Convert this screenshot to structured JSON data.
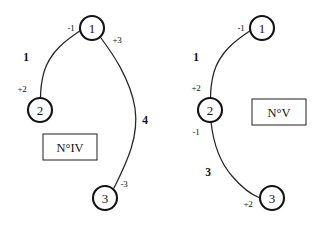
{
  "figure": {
    "background_color": "#ffffff",
    "ink_color": "#141414",
    "diagrams": [
      {
        "id": "diagram-iv",
        "caption": "N°IV",
        "nodes": [
          {
            "id": "n1",
            "label": "1",
            "cx": 92,
            "cy": 28,
            "r": 12
          },
          {
            "id": "n2",
            "label": "2",
            "cx": 40,
            "cy": 110,
            "r": 12
          },
          {
            "id": "n3",
            "label": "3",
            "cx": 105,
            "cy": 198,
            "r": 12
          }
        ],
        "edges": [
          {
            "id": "e12",
            "from": "n1",
            "to": "n2",
            "weight": "1",
            "weight_x": 26,
            "weight_y": 57,
            "tail_port": "-1",
            "tail_port_x": 71,
            "tail_port_y": 28,
            "head_port": "+2",
            "head_port_x": 22,
            "head_port_y": 89,
            "path": "M 80.5 30.5 C 66 40 50 52 44 72 C 41.5 81 40.5 90 40.5 98"
          },
          {
            "id": "e13",
            "from": "n1",
            "to": "n3",
            "weight": "4",
            "weight_x": 145,
            "weight_y": 120,
            "tail_port": "+3",
            "tail_port_x": 117,
            "tail_port_y": 40,
            "head_port": "-3",
            "head_port_x": 124,
            "head_port_y": 184,
            "path": "M 101 38 C 112 53 130 78 135 108 C 139 136 128 160 114 188"
          }
        ],
        "box": {
          "x": 43,
          "y": 134,
          "width": 54,
          "height": 26
        }
      },
      {
        "id": "diagram-v",
        "caption": "N°V",
        "nodes": [
          {
            "id": "n1",
            "label": "1",
            "cx": 262,
            "cy": 28,
            "r": 12
          },
          {
            "id": "n2",
            "label": "2",
            "cx": 210,
            "cy": 110,
            "r": 12
          },
          {
            "id": "n3",
            "label": "3",
            "cx": 272,
            "cy": 198,
            "r": 12
          }
        ],
        "edges": [
          {
            "id": "e12",
            "from": "n1",
            "to": "n2",
            "weight": "1",
            "weight_x": 196,
            "weight_y": 57,
            "tail_port": "-1",
            "tail_port_x": 241,
            "tail_port_y": 28,
            "head_port": "+2",
            "head_port_x": 196,
            "head_port_y": 88,
            "path": "M 250.5 30.5 C 236 40 220 52 214 72 C 211.5 81 210.5 90 210.5 98"
          },
          {
            "id": "e23",
            "from": "n2",
            "to": "n3",
            "weight": "3",
            "weight_x": 208,
            "weight_y": 172,
            "tail_port": "-1",
            "tail_port_x": 196,
            "tail_port_y": 132,
            "head_port": "+2",
            "head_port_x": 248,
            "head_port_y": 204,
            "path": "M 211 122 C 213 140 218 160 232 176 C 243 189 252 195 260 198"
          }
        ],
        "box": {
          "x": 252,
          "y": 99,
          "width": 54,
          "height": 26
        }
      }
    ]
  }
}
